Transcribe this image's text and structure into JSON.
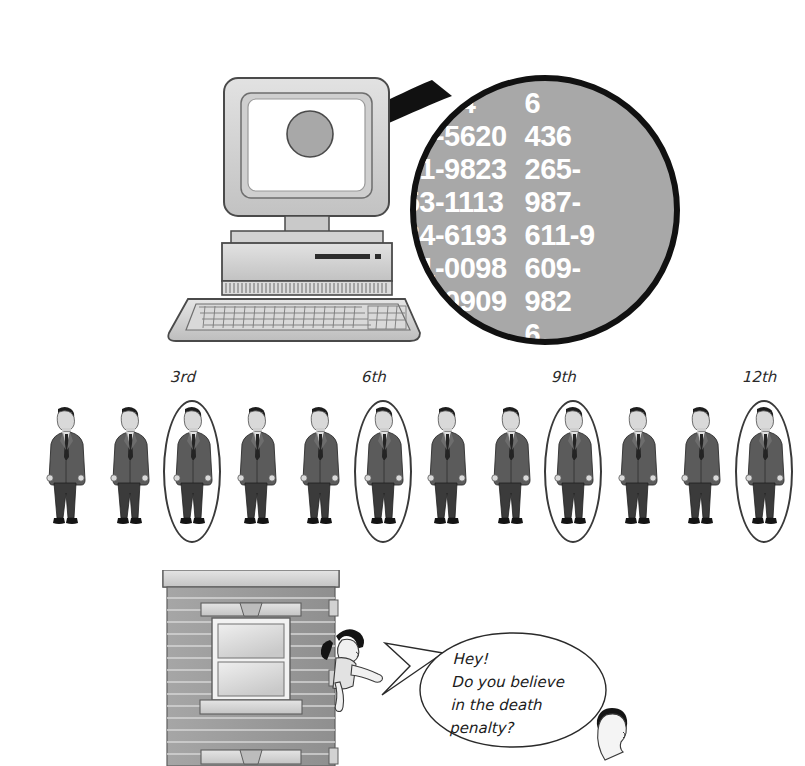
{
  "figure": {
    "panels": [
      "computer-phone-list",
      "systematic-sample-line",
      "street-interview"
    ]
  },
  "panel_computer": {
    "label": "computer with magnified phone directory",
    "screen_state": "blank",
    "magnifier": {
      "label": "magnifying glass",
      "left_column": [
        "6-1234",
        "427-5620",
        "931-9823",
        "553-1113",
        "434-6193",
        "231-0098",
        "329-0909",
        "3-1282"
      ],
      "right_column": [
        "6",
        "436",
        "265-",
        "987-",
        "611-9",
        "609-",
        "982",
        "6"
      ]
    }
  },
  "panel_people": {
    "label": "row of twelve people with every third circled",
    "total_people": 12,
    "circled_positions": [
      3,
      6,
      9,
      12
    ],
    "tick_labels": [
      {
        "text": "3rd",
        "position": 3
      },
      {
        "text": "6th",
        "position": 6
      },
      {
        "text": "9th",
        "position": 9
      },
      {
        "text": "12th",
        "position": 12
      }
    ]
  },
  "panel_street": {
    "label": "woman leaning out of apartment window talking to passerby",
    "speech_bubble": {
      "lines": [
        "Hey!",
        "Do you believe",
        "in the death",
        "penalty?"
      ]
    },
    "building": {
      "label": "apartment building with siding and window"
    },
    "woman": {
      "label": "woman in window"
    },
    "passerby": {
      "label": "person on street"
    }
  },
  "colors": {
    "ink": "#111111",
    "magnifier_fill": "#a8a8a8",
    "magnifier_text": "#ffffff",
    "device_light": "#d8d8d8",
    "device_mid": "#bdbdbd",
    "device_dark": "#9a9a9a",
    "ring_stroke": "#3a3a3a",
    "wall": "#9d9d9d",
    "paper": "#ffffff"
  }
}
